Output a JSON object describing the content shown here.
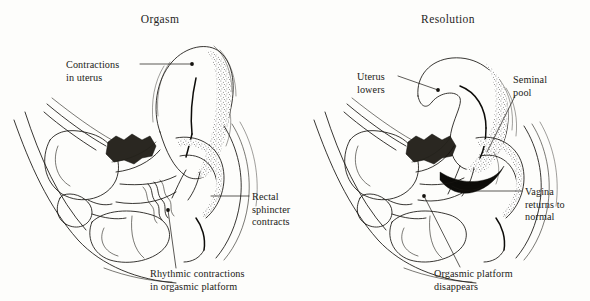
{
  "figure": {
    "kind": "anatomical-line-illustration",
    "background_color": "#fdfdfb",
    "ink_color": "#15130f"
  },
  "panels": [
    {
      "id": "orgasm",
      "title": "Orgasm",
      "title_x": 160,
      "title_y": 23,
      "labels": [
        {
          "id": "contractions-in-uterus",
          "lines": [
            "Contractions",
            "in uterus"
          ],
          "text_x": 66,
          "text_y": 68,
          "anchor": "start",
          "leader": "M 140 64 L 192 64",
          "marker": [
            192,
            64
          ]
        },
        {
          "id": "rectal-sphincter-contracts",
          "lines": [
            "Rectal",
            "sphincter",
            "contracts"
          ],
          "text_x": 252,
          "text_y": 200,
          "anchor": "start",
          "leader": "M 249 196 L 214 196",
          "marker": [
            214,
            196
          ]
        },
        {
          "id": "rhythmic-contractions-in-orgasmic-platform",
          "lines": [
            "Rhythmic contractions",
            "in orgasmic platform"
          ],
          "text_x": 150,
          "text_y": 277,
          "anchor": "start",
          "leader": "M 176 268 L 168 210",
          "marker": [
            168,
            210
          ]
        }
      ]
    },
    {
      "id": "resolution",
      "title": "Resolution",
      "title_x": 448,
      "title_y": 23,
      "labels": [
        {
          "id": "uterus-lowers",
          "lines": [
            "Uterus",
            "lowers"
          ],
          "text_x": 357,
          "text_y": 80,
          "anchor": "start",
          "leader": "M 398 76 L 438 90",
          "marker": [
            438,
            90
          ]
        },
        {
          "id": "seminal-pool",
          "lines": [
            "Seminal",
            "pool"
          ],
          "text_x": 513,
          "text_y": 83,
          "anchor": "start",
          "leader": "M 515 96 L 487 152",
          "marker": [
            487,
            152
          ]
        },
        {
          "id": "vagina-returns-to-normal",
          "lines": [
            "Vagina",
            "returns to",
            "normal"
          ],
          "text_x": 525,
          "text_y": 195,
          "anchor": "start",
          "leader": "M 522 191 L 463 191",
          "marker": [
            463,
            191
          ]
        },
        {
          "id": "orgasmic-platform-disappears",
          "lines": [
            "Orgasmic platform",
            "disappears"
          ],
          "text_x": 434,
          "text_y": 277,
          "anchor": "start",
          "leader": "M 460 267 L 424 196",
          "marker": [
            424,
            196
          ]
        }
      ]
    }
  ]
}
